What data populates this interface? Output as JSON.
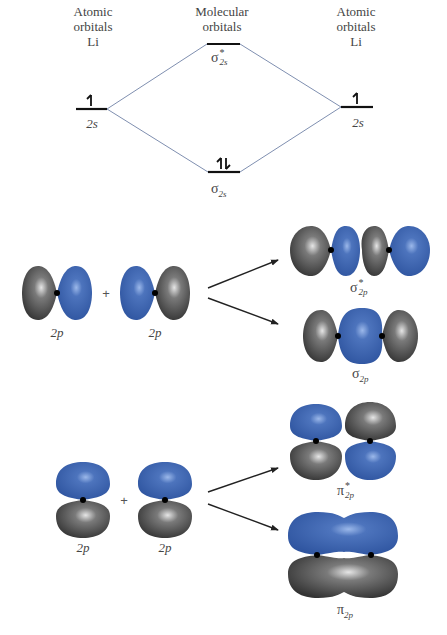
{
  "energy_diagram": {
    "left_header": [
      "Atomic",
      "orbitals",
      "Li"
    ],
    "center_header": [
      "Molecular",
      "orbitals"
    ],
    "right_header": [
      "Atomic",
      "orbitals",
      "Li"
    ],
    "left_level": {
      "label": "2s",
      "electrons": "↿"
    },
    "right_level": {
      "label": "2s",
      "electrons": "↿"
    },
    "antibonding_level": {
      "symbol": "σ",
      "superscript": "*",
      "subscript": "2s",
      "electrons": ""
    },
    "bonding_level": {
      "symbol": "σ",
      "subscript": "2s",
      "electrons": "⇅"
    },
    "colors": {
      "level_line": "#111111",
      "connector_line": "#7f8fb0"
    }
  },
  "sigma_row": {
    "left_orbital_label": "2p",
    "right_orbital_label": "2p",
    "plus": "+",
    "antibonding": {
      "symbol": "σ",
      "superscript": "*",
      "subscript": "2p"
    },
    "bonding": {
      "symbol": "σ",
      "subscript": "2p"
    }
  },
  "pi_row": {
    "left_orbital_label": "2p",
    "right_orbital_label": "2p",
    "plus": "+",
    "antibonding": {
      "symbol": "π",
      "superscript": "*",
      "subscript": "2p"
    },
    "bonding": {
      "symbol": "π",
      "subscript": "2p"
    }
  },
  "colors": {
    "blue_lobe": "#3b62a8",
    "blue_highlight": "#8fb0e6",
    "gray_lobe": "#4a4a4a",
    "gray_highlight": "#d8d8d8",
    "nucleus": "#000000",
    "arrow": "#222222"
  }
}
